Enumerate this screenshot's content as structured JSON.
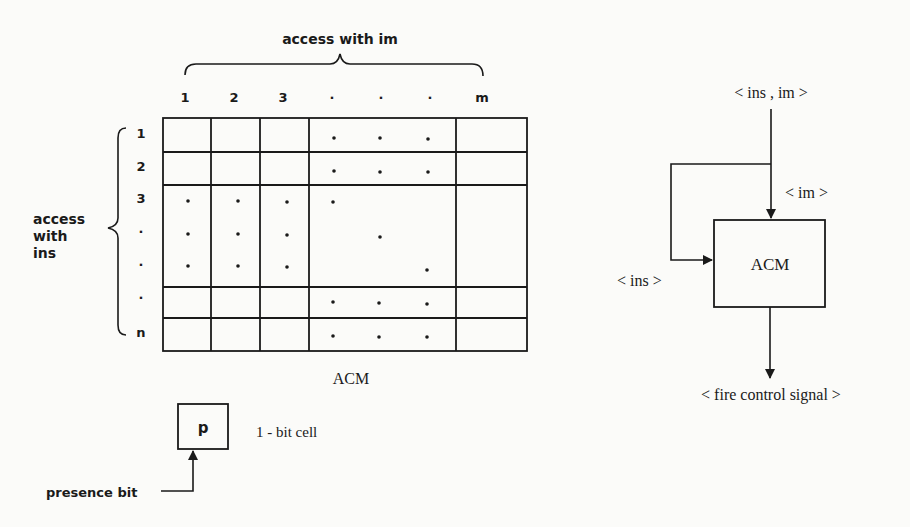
{
  "matrix": {
    "title": "ACM",
    "column_axis_label": "access with im",
    "row_axis_label_lines": [
      "access",
      "with",
      "ins"
    ],
    "column_labels": [
      "1",
      "2",
      "3",
      "·",
      "·",
      "·",
      "m"
    ],
    "row_labels": [
      "1",
      "2",
      "3",
      "·",
      "·",
      "·",
      "n"
    ]
  },
  "cell_legend": {
    "cell_symbol": "p",
    "cell_label": "1 - bit cell",
    "pointer_label": "presence bit"
  },
  "block_diagram": {
    "input_label": "< ins , im >",
    "im_label": "< im >",
    "ins_label": "< ins >",
    "box_label": "ACM",
    "output_label": "< fire control signal >"
  }
}
